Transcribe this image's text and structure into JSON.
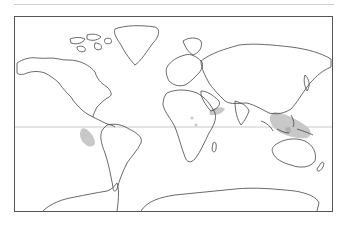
{
  "map": {
    "projection": "world outline map",
    "equator_line": true,
    "colors": {
      "coastline": "#444444",
      "shaded_region": "#c8c8c8",
      "frame": "#555555",
      "equator": "#bbbbbb"
    },
    "shaded_regions": [
      {
        "name": "eastern-pacific-off-peru",
        "label": ""
      },
      {
        "name": "arabian-sea",
        "label": ""
      },
      {
        "name": "east-africa-coast-spots",
        "label": ""
      },
      {
        "name": "indo-pacific-indonesia",
        "label": ""
      }
    ]
  }
}
